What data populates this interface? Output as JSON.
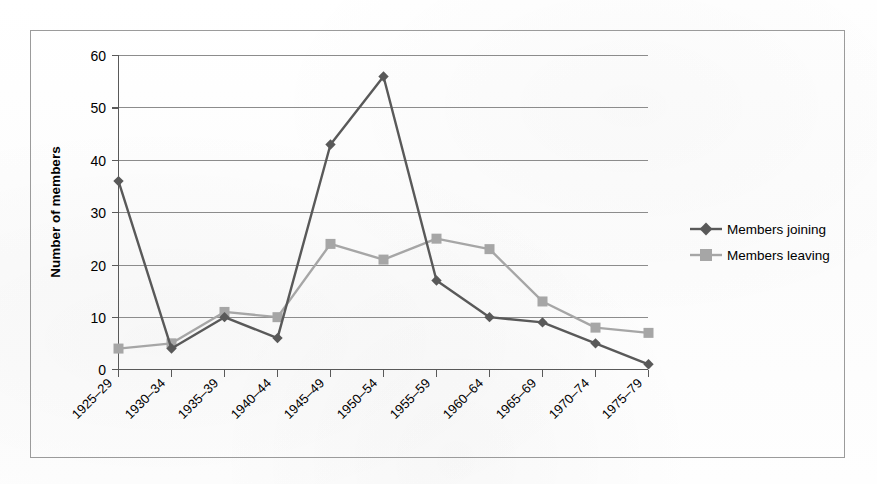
{
  "chart_data": {
    "type": "line",
    "title": "",
    "subtitle": "",
    "xlabel": "",
    "ylabel": "Number of members",
    "categories": [
      "1925–29",
      "1930–34",
      "1935–39",
      "1940–44",
      "1945–49",
      "1950–54",
      "1955–59",
      "1960–64",
      "1965–69",
      "1970–74",
      "1975–79"
    ],
    "series": [
      {
        "name": "Members joining",
        "marker": "diamond",
        "color": "#595959",
        "values": [
          36,
          4,
          10,
          6,
          43,
          56,
          17,
          10,
          9,
          5,
          1
        ]
      },
      {
        "name": "Members leaving",
        "marker": "square",
        "color": "#a6a6a6",
        "values": [
          4,
          5,
          11,
          10,
          24,
          21,
          25,
          23,
          13,
          8,
          7
        ]
      }
    ],
    "ylim": [
      0,
      60
    ],
    "y_ticks": [
      0,
      10,
      20,
      30,
      40,
      50,
      60
    ],
    "y_tick_labels": [
      "0",
      "10",
      "20",
      "30",
      "40",
      "50",
      "60"
    ],
    "grid": "horizontal",
    "grid_color": "#808080",
    "legend_position": "right",
    "x_tick_label_rotation": -45,
    "plot_background": "#ffffff",
    "frame_border_color": "#9b9b9b"
  },
  "legend": {
    "entries": [
      {
        "label": "Members joining"
      },
      {
        "label": "Members leaving"
      }
    ]
  },
  "axes": {
    "y_title": "Number of members",
    "y_labels": [
      "60",
      "50",
      "40",
      "30",
      "20",
      "10",
      "0"
    ],
    "x_labels": [
      "1925–29",
      "1930–34",
      "1935–39",
      "1940–44",
      "1945–49",
      "1950–54",
      "1955–59",
      "1960–64",
      "1965–69",
      "1970–74",
      "1975–79"
    ]
  }
}
